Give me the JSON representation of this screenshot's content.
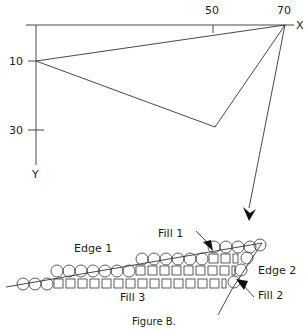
{
  "axes": {
    "x_label": "X",
    "y_label": "Y",
    "x_ticks": [
      "50",
      "70"
    ],
    "y_ticks": [
      "10",
      "30"
    ]
  },
  "labels": {
    "edge1": "Edge  1",
    "edge2": "Edge  2",
    "fill1": "Fill  1",
    "fill2": "Fill  2",
    "fill3": "Fill  3"
  },
  "caption": "Figure  B.",
  "triangle_vertices": [
    [
      10,
      10
    ],
    [
      70,
      0
    ],
    [
      50,
      28
    ]
  ],
  "colors": {
    "line": "#333333",
    "text": "#1a1a1a",
    "background": "#ffffff"
  }
}
